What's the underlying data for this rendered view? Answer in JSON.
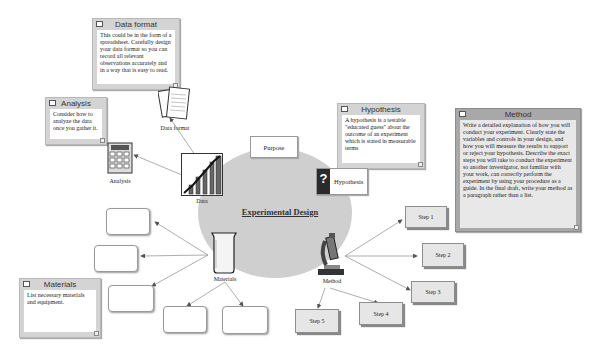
{
  "diagram": {
    "title": "Experimental Design",
    "center_color": "#cfcfcf",
    "nodes": {
      "purpose": {
        "label": "Purpose"
      },
      "hypothesis": {
        "label": "Hypothesis",
        "icon": "question-mark-icon"
      },
      "data": {
        "label": "Data",
        "icon": "bar-chart-icon"
      },
      "analysis": {
        "label": "Analysis",
        "icon": "calculator-icon"
      },
      "data_format": {
        "label": "Data format",
        "icon": "papers-icon"
      },
      "materials": {
        "label": "Materials",
        "icon": "beaker-icon"
      },
      "method": {
        "label": "Method",
        "icon": "microscope-icon"
      }
    },
    "steps": [
      "Step 1",
      "Step 2",
      "Step 3",
      "Step 4",
      "Step 5"
    ],
    "notes": {
      "data_format": {
        "title": "Data format",
        "body": "This could be in the form of a spreadsheet. Carefully design your data format so you can record all relevant observations accurately and in a way that is easy to read."
      },
      "analysis": {
        "title": "Analysis",
        "body": "Consider how to analyze the data once you gather it."
      },
      "hypothesis": {
        "title": "Hypothesis",
        "body": "A hypothesis is a testable \"educated guess\" about the outcome of an experiment which is stated in measurable terms"
      },
      "method": {
        "title": "Method",
        "body": "Write a detailed explanation of how you will conduct your experiment. Clearly state the variables and controls in your design, and how you will measure the results to support or reject your hypothesis. Describe the exact steps you will take to conduct the experiment so another investigator, not familiar with your work, can correctly perform the experiment by using your procedure as a guide. In the final draft, write your method as a paragraph rather than a list."
      },
      "materials": {
        "title": "Materials",
        "body": "List necessary materials and equipment."
      }
    },
    "blank_material_boxes": 5
  }
}
